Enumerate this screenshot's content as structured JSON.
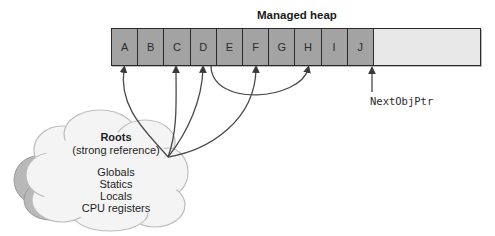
{
  "diagram": {
    "heap_title": "Managed heap",
    "cells": [
      "A",
      "B",
      "C",
      "D",
      "E",
      "F",
      "G",
      "H",
      "I",
      "J"
    ],
    "next_obj_ptr_label": "NextObjPtr",
    "roots": {
      "title": "Roots",
      "subtitle": "(strong reference)",
      "items": [
        "Globals",
        "Statics",
        "Locals",
        "CPU registers"
      ]
    },
    "references": [
      {
        "from": "Roots",
        "to": "A"
      },
      {
        "from": "Roots",
        "to": "C"
      },
      {
        "from": "Roots",
        "to": "D"
      },
      {
        "from": "Roots",
        "to": "F"
      },
      {
        "from": "D",
        "to": "H"
      }
    ],
    "colors": {
      "allocated_cell": "#a3a3a3",
      "free_space": "#e8e8e8",
      "border": "#2a2a2a",
      "arrow": "#4a4a4a",
      "cloud_fill": "#f4f4f4",
      "cloud_shadow": "#b8b8b8"
    }
  }
}
